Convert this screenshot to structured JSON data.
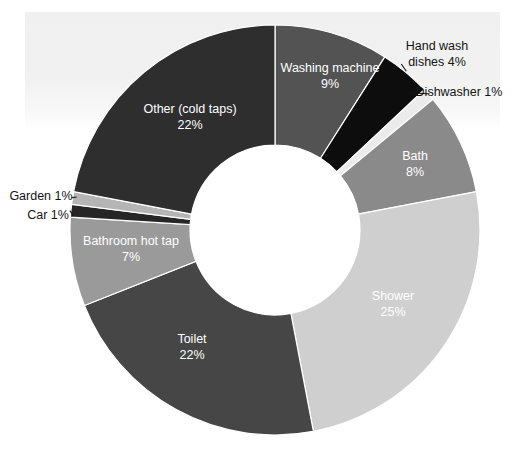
{
  "chart_data": {
    "type": "pie",
    "variant": "donut",
    "title": "",
    "subtitle": "",
    "xlabel": "",
    "ylabel": "",
    "legend": "none",
    "grid": false,
    "value_unit": "%",
    "total": 100,
    "start_angle_deg": 0,
    "direction": "clockwise",
    "categories": [
      "Washing machine",
      "Hand wash dishes",
      "Dishwasher",
      "Bath",
      "Shower",
      "Toilet",
      "Bathroom hot tap",
      "Car",
      "Garden",
      "Other (cold taps)"
    ],
    "values": [
      9,
      4,
      1,
      8,
      25,
      22,
      7,
      1,
      1,
      22
    ],
    "colors": [
      "#535353",
      "#0d0d0d",
      "#ebebeb",
      "#8a8a8a",
      "#cfcfcf",
      "#464646",
      "#9a9a9a",
      "#262626",
      "#b5b5b5",
      "#2e2e2e"
    ],
    "slices": [
      {
        "name": "Washing machine",
        "value": 9,
        "value_label": "9%",
        "color": "#535353",
        "label_line1": "Washing machine",
        "label_line2": "9%",
        "label_placement": "inside",
        "label_x": 330,
        "label_y": 77,
        "label_color": "#ffffff"
      },
      {
        "name": "Hand wash dishes",
        "value": 4,
        "value_label": "4%",
        "color": "#0d0d0d",
        "label_line1": "Hand wash",
        "label_line2": "dishes 4%",
        "label_placement": "outside",
        "label_x": 437,
        "label_y": 55,
        "label_color": "#141414"
      },
      {
        "name": "Dishwasher",
        "value": 1,
        "value_label": "1%",
        "color": "#ebebeb",
        "label_line1": "Dishwasher 1%",
        "label_line2": "",
        "label_placement": "outside",
        "label_x": 459,
        "label_y": 93,
        "label_color": "#141414"
      },
      {
        "name": "Bath",
        "value": 8,
        "value_label": "8%",
        "color": "#8a8a8a",
        "label_line1": "Bath",
        "label_line2": "8%",
        "label_placement": "inside",
        "label_x": 415,
        "label_y": 165,
        "label_color": "#141414"
      },
      {
        "name": "Shower",
        "value": 25,
        "value_label": "25%",
        "color": "#cfcfcf",
        "label_line1": "Shower",
        "label_line2": "25%",
        "label_placement": "inside",
        "label_x": 393,
        "label_y": 305,
        "label_color": "#141414"
      },
      {
        "name": "Toilet",
        "value": 22,
        "value_label": "22%",
        "color": "#464646",
        "label_line1": "Toilet",
        "label_line2": "22%",
        "label_placement": "inside",
        "label_x": 192,
        "label_y": 348,
        "label_color": "#ffffff"
      },
      {
        "name": "Bathroom hot tap",
        "value": 7,
        "value_label": "7%",
        "color": "#9a9a9a",
        "label_line1": "Bathroom hot tap",
        "label_line2": "7%",
        "label_placement": "inside",
        "label_x": 131,
        "label_y": 250,
        "label_color": "#ffffff"
      },
      {
        "name": "Car",
        "value": 1,
        "value_label": "1%",
        "color": "#262626",
        "label_line1": "Car 1%",
        "label_line2": "",
        "label_placement": "outside",
        "label_x": 48,
        "label_y": 216,
        "label_color": "#141414"
      },
      {
        "name": "Garden",
        "value": 1,
        "value_label": "1%",
        "color": "#b5b5b5",
        "label_line1": "Garden 1%",
        "label_line2": "",
        "label_placement": "outside",
        "label_x": 41,
        "label_y": 197,
        "label_color": "#141414"
      },
      {
        "name": "Other (cold taps)",
        "value": 22,
        "value_label": "22%",
        "color": "#2e2e2e",
        "label_line1": "Other (cold taps)",
        "label_line2": "22%",
        "label_placement": "inside",
        "label_x": 190,
        "label_y": 118,
        "label_color": "#ffffff"
      }
    ]
  },
  "geometry": {
    "cx": 275,
    "cy": 230,
    "outer_radius": 205,
    "inner_radius": 85
  },
  "background": {
    "page": "#ffffff",
    "panel": "#f0f0f0"
  }
}
